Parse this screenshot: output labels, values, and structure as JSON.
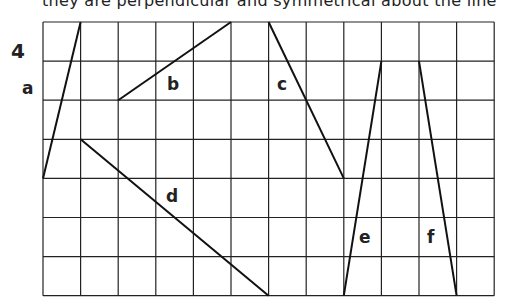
{
  "header_text": "they are perpendicular and symmetrical about the line",
  "question_number": "4",
  "grid": {
    "cols": 12,
    "rows": 7,
    "origin_x": 43,
    "origin_y": 22,
    "cell_w": 37.6,
    "cell_h": 39.1,
    "line_color": "#222222"
  },
  "segments": [
    {
      "label": "a",
      "from": [
        0,
        4
      ],
      "to": [
        1,
        0
      ],
      "label_pos": [
        22,
        78
      ]
    },
    {
      "label": "b",
      "from": [
        2,
        2
      ],
      "to": [
        5,
        0
      ],
      "label_pos": [
        167,
        74
      ]
    },
    {
      "label": "c",
      "from": [
        6,
        0
      ],
      "to": [
        8,
        4
      ],
      "label_pos": [
        277,
        74
      ]
    },
    {
      "label": "d",
      "from": [
        1,
        3
      ],
      "to": [
        6,
        7
      ],
      "label_pos": [
        166,
        186
      ]
    },
    {
      "label": "e",
      "from": [
        8,
        7
      ],
      "to": [
        9,
        1
      ],
      "label_pos": [
        359,
        227
      ]
    },
    {
      "label": "f",
      "from": [
        10,
        1
      ],
      "to": [
        11,
        7
      ],
      "label_pos": [
        427,
        227
      ]
    }
  ]
}
